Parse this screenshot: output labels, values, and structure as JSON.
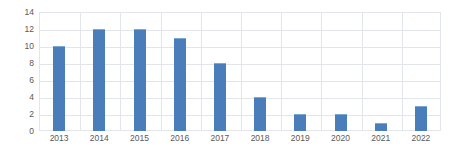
{
  "chart_data": {
    "type": "bar",
    "title": "",
    "subtitle": "",
    "xlabel": "",
    "ylabel": "",
    "categories": [
      "2013",
      "2014",
      "2015",
      "2016",
      "2017",
      "2018",
      "2019",
      "2020",
      "2021",
      "2022"
    ],
    "values": [
      10,
      12,
      12,
      11,
      8,
      4,
      2,
      2,
      1,
      3
    ],
    "series": [
      {
        "name": "",
        "values": [
          10,
          12,
          12,
          11,
          8,
          4,
          2,
          2,
          1,
          3
        ],
        "color": "#4a7ebb"
      }
    ],
    "ylim": [
      0,
      14
    ],
    "y_ticks": [
      0,
      2,
      4,
      6,
      8,
      10,
      12,
      14
    ],
    "y_tick_labels": [
      "0",
      "2",
      "4",
      "6",
      "8",
      "10",
      "12",
      "14"
    ],
    "y_tick_interval": 2,
    "grid": {
      "horizontal": true,
      "vertical": true,
      "color": "#e2e5e9"
    },
    "legend": {
      "visible": false,
      "position": "none",
      "entries": []
    },
    "annotations": [],
    "data_labels": false,
    "bar_color": "#4a7ebb",
    "bar_edge_color": "#7ba7d4",
    "background_color": "#ffffff",
    "axis_text_color": "#595959",
    "plot_border_color": "#e2e5e9"
  }
}
